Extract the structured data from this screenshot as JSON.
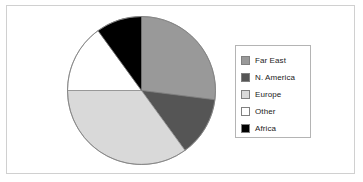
{
  "chart_data": {
    "type": "pie",
    "title": "",
    "categories": [
      "Far East",
      "N. America",
      "Europe",
      "Other",
      "Africa"
    ],
    "values": [
      27,
      13,
      35,
      15,
      10
    ],
    "units": "percent",
    "start_angle_deg": 0,
    "direction": "clockwise",
    "slice_angles_deg": [
      97.2,
      46.8,
      126.0,
      54.0,
      36.0
    ],
    "colors": [
      "#999999",
      "#555555",
      "#d9d9d9",
      "#ffffff",
      "#000000"
    ],
    "legend_position": "right",
    "grid": false,
    "xlabel": "",
    "ylabel": "",
    "slices": [
      {
        "label": "Far East",
        "value": 27,
        "color": "#999999",
        "start_deg": 0.0,
        "end_deg": 97.2
      },
      {
        "label": "N. America",
        "value": 13,
        "color": "#555555",
        "start_deg": 97.2,
        "end_deg": 144.0
      },
      {
        "label": "Europe",
        "value": 35,
        "color": "#d9d9d9",
        "start_deg": 144.0,
        "end_deg": 270.0
      },
      {
        "label": "Other",
        "value": 15,
        "color": "#ffffff",
        "start_deg": 270.0,
        "end_deg": 324.0
      },
      {
        "label": "Africa",
        "value": 10,
        "color": "#000000",
        "start_deg": 324.0,
        "end_deg": 360.0
      }
    ]
  },
  "legend": {
    "items": [
      {
        "label": "Far East",
        "swatch_color": "#999999"
      },
      {
        "label": "N. America",
        "swatch_color": "#555555"
      },
      {
        "label": "Europe",
        "swatch_color": "#d9d9d9"
      },
      {
        "label": "Other",
        "swatch_color": "#ffffff"
      },
      {
        "label": "Africa",
        "swatch_color": "#000000"
      }
    ]
  },
  "style": {
    "frame_border_color": "#d0d0d0",
    "legend_border_color": "#b4b4b4",
    "pie_outline_color": "#808080",
    "background": "#ffffff"
  }
}
